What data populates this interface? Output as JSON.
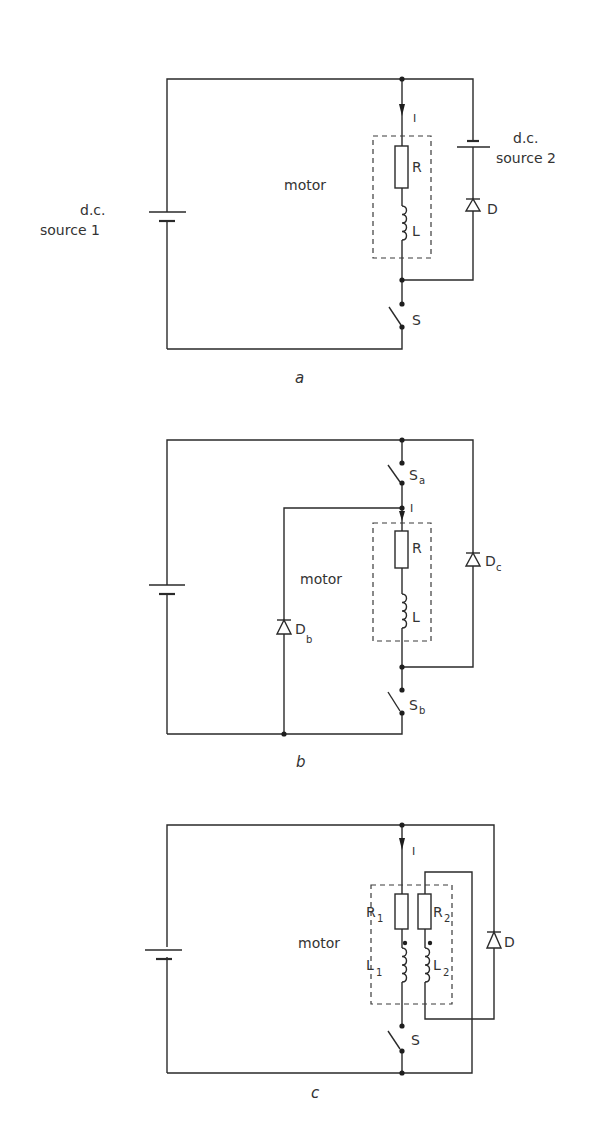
{
  "figures": {
    "a": {
      "caption": "a",
      "source1_line1": "d.c.",
      "source1_line2": "source 1",
      "source2_line1": "d.c.",
      "source2_line2": "source 2",
      "motor": "motor",
      "current": "I",
      "resistor": "R",
      "inductor": "L",
      "diode": "D",
      "switch": "S"
    },
    "b": {
      "caption": "b",
      "motor": "motor",
      "current": "I",
      "resistor": "R",
      "inductor": "L",
      "switch_a": "S",
      "switch_a_sub": "a",
      "switch_b": "S",
      "switch_b_sub": "b",
      "diode_b": "D",
      "diode_b_sub": "b",
      "diode_c": "D",
      "diode_c_sub": "c"
    },
    "c": {
      "caption": "c",
      "motor": "motor",
      "current": "I",
      "resistor1": "R",
      "resistor1_sub": "1",
      "resistor2": "R",
      "resistor2_sub": "2",
      "inductor1": "L",
      "inductor1_sub": "1",
      "inductor2": "L",
      "inductor2_sub": "2",
      "diode": "D",
      "switch": "S"
    }
  },
  "colors": {
    "line": "#2a2a2a",
    "text": "#333333",
    "background": "#ffffff"
  }
}
